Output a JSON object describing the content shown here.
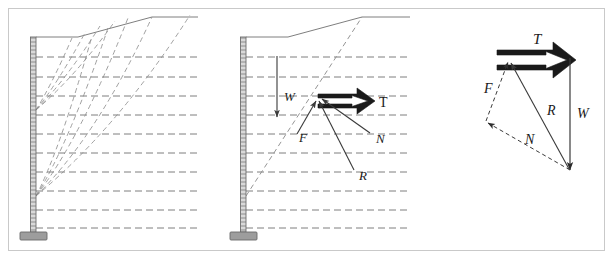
{
  "figure": {
    "frame": {
      "border_color": "#c9c9c9",
      "background": "#ffffff"
    },
    "colors": {
      "wall": "#8a8a8a",
      "wall_fill": "#d8d8d8",
      "footing": "#9a9a9a",
      "ground_line": "#6f6f6f",
      "reinforcement_dash": "#707070",
      "failure_surface": "#8f8f8f",
      "vector_solid": "#3a3a3a",
      "vector_heavy": "#1a1a1a",
      "label_text": "#1a1a1a"
    }
  },
  "panels": [
    {
      "id": "panel-a",
      "name": "trial-failure-surfaces",
      "description": "Retaining wall with multiple trial log-spiral failure surfaces",
      "wall": {
        "type": "vertical-hatched-stem",
        "top_y": 38,
        "base_y": 232,
        "x": 33,
        "thickness": 5
      },
      "footing": {
        "label": "footing-pad",
        "width": 26,
        "height": 7
      },
      "ground_surface": {
        "segments": [
          {
            "from": [
              36,
              37
            ],
            "to": [
              78,
              37
            ],
            "kind": "flat-bench"
          },
          {
            "from": [
              78,
              37
            ],
            "to": [
              152,
              17
            ],
            "kind": "backslope"
          },
          {
            "from": [
              152,
              17
            ],
            "to": [
              198,
              17
            ],
            "kind": "flat-crest"
          }
        ]
      },
      "reinforcement_layers": {
        "count": 10,
        "style": "dashed-horizontal",
        "y_positions": [
          57,
          77,
          96,
          115,
          134,
          153,
          172,
          191,
          210,
          228
        ],
        "x_start": 36,
        "x_end": 198
      },
      "failure_surfaces": {
        "count": 9,
        "style": "dashed-curve",
        "origin_points": [
          {
            "label": "upper-fan-origin",
            "x": 36,
            "y": 110
          },
          {
            "label": "lower-fan-origin",
            "x": 36,
            "y": 196
          }
        ]
      }
    },
    {
      "id": "panel-b",
      "name": "force-equilibrium-on-wedge",
      "description": "Single trial wedge with W, T, F, N, R forces shown",
      "wall": {
        "type": "vertical-hatched-stem",
        "top_y": 38,
        "base_y": 232,
        "x": 243,
        "thickness": 5
      },
      "footing": {
        "label": "footing-pad",
        "width": 26,
        "height": 7
      },
      "ground_surface": {
        "segments": [
          {
            "from": [
              246,
              37
            ],
            "to": [
              288,
              37
            ],
            "kind": "flat-bench"
          },
          {
            "from": [
              288,
              37
            ],
            "to": [
              362,
              17
            ],
            "kind": "backslope"
          },
          {
            "from": [
              362,
              17
            ],
            "to": [
              410,
              17
            ],
            "kind": "flat-crest"
          }
        ]
      },
      "reinforcement_layers": {
        "count": 10,
        "style": "dashed-horizontal",
        "y_positions": [
          57,
          77,
          96,
          115,
          134,
          153,
          172,
          191,
          210,
          228
        ],
        "x_start": 246,
        "x_end": 410
      },
      "failure_surface": {
        "style": "dashed-line",
        "from": [
          246,
          196
        ],
        "to": [
          362,
          17
        ]
      },
      "forces": [
        {
          "symbol": "W",
          "name": "weight-vector",
          "style": "solid-thin-arrow",
          "direction": "down",
          "from": [
            277,
            56
          ],
          "to": [
            277,
            115
          ],
          "label_pos": [
            284,
            97
          ]
        },
        {
          "symbol": "T",
          "name": "tension-vector",
          "style": "hollow-double-arrow",
          "direction": "right",
          "from": [
            318,
            101
          ],
          "to": [
            374,
            101
          ],
          "label_pos": [
            381,
            105
          ]
        },
        {
          "symbol": "F",
          "name": "friction-vector",
          "style": "solid-thin-arrow",
          "direction": "up-right",
          "from": [
            298,
            133
          ],
          "to": [
            317,
            100
          ],
          "label_pos": [
            301,
            137
          ]
        },
        {
          "symbol": "N",
          "name": "normal-leader",
          "style": "solid-thin-arrow",
          "direction": "up-left",
          "from": [
            371,
            134
          ],
          "to": [
            321,
            98
          ],
          "label_pos": [
            377,
            139
          ]
        },
        {
          "symbol": "R",
          "name": "resultant-leader",
          "style": "solid-thin-arrow",
          "direction": "up-left",
          "from": [
            355,
            170
          ],
          "to": [
            319,
            100
          ],
          "label_pos": [
            360,
            176
          ]
        }
      ]
    },
    {
      "id": "panel-c",
      "name": "force-polygon",
      "description": "Closed force polygon for the trial wedge",
      "vectors": [
        {
          "symbol": "T",
          "name": "tension-vector",
          "style": "hollow-double-arrow",
          "from": [
            497,
            57
          ],
          "to": [
            570,
            57
          ],
          "label_pos": [
            537,
            47
          ]
        },
        {
          "symbol": "W",
          "name": "weight-vector",
          "style": "solid-thin-arrow",
          "from": [
            570,
            57
          ],
          "to": [
            570,
            168
          ],
          "label_pos": [
            578,
            115
          ]
        },
        {
          "symbol": "N",
          "name": "normal-vector",
          "style": "dashed-thin-arrow",
          "from": [
            570,
            168
          ],
          "to": [
            487,
            122
          ],
          "label_pos": [
            528,
            140
          ]
        },
        {
          "symbol": "F",
          "name": "friction-vector",
          "style": "dashed-thin-arrow",
          "from": [
            487,
            122
          ],
          "to": [
            509,
            62
          ],
          "label_pos": [
            488,
            88
          ]
        },
        {
          "symbol": "R",
          "name": "resultant-vector",
          "style": "solid-thin-arrow",
          "from": [
            570,
            168
          ],
          "to": [
            510,
            62
          ],
          "label_pos": [
            550,
            113
          ]
        }
      ]
    }
  ],
  "labels": {
    "T": "T",
    "W": "W",
    "F": "F",
    "N": "N",
    "R": "R",
    "T_polygon": "T",
    "W_polygon": "W",
    "F_polygon": "F",
    "N_polygon": "N",
    "R_polygon": "R"
  }
}
